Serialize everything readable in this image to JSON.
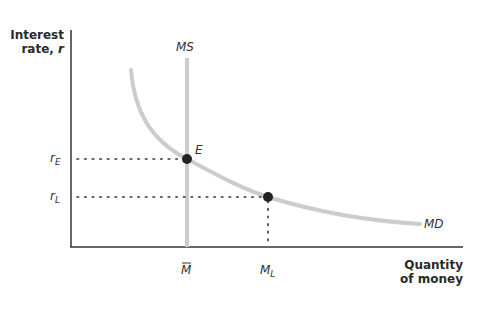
{
  "diagram": {
    "type": "money market equilibrium",
    "y_axis_label_line1": "Interest",
    "y_axis_label_line2": "rate,",
    "y_axis_label_var": "r",
    "x_axis_label_line1": "Quantity",
    "x_axis_label_line2": "of money",
    "supply_label": "MS",
    "demand_label": "MD",
    "equilibrium_label": "E",
    "rate_E_base": "r",
    "rate_E_sub": "E",
    "rate_L_base": "r",
    "rate_L_sub": "L",
    "money_bar_label": "M",
    "money_L_base": "M",
    "money_L_sub": "L",
    "colors": {
      "axis": "#333333",
      "curve": "#cccccc",
      "point": "#222222",
      "text": "#333333"
    }
  }
}
